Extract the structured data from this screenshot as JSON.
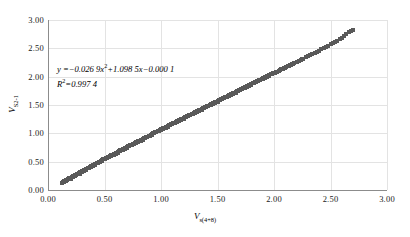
{
  "chart_data": {
    "type": "scatter",
    "title": "",
    "xlabel": "V_s(4+8)",
    "xlabel_base": "V",
    "xlabel_sub": "s(4+8)",
    "ylabel": "V_S2-1",
    "ylabel_base": "V",
    "ylabel_sub": "S2-1",
    "xlim": [
      0.0,
      3.0
    ],
    "ylim": [
      0.0,
      3.0
    ],
    "xticks": [
      "0.00",
      "0.50",
      "1.00",
      "1.50",
      "2.00",
      "2.50",
      "3.00"
    ],
    "yticks": [
      "0.00",
      "0.50",
      "1.00",
      "1.50",
      "2.00",
      "2.50",
      "3.00"
    ],
    "xtick_values": [
      0.0,
      0.5,
      1.0,
      1.5,
      2.0,
      2.5,
      3.0
    ],
    "ytick_values": [
      0.0,
      0.5,
      1.0,
      1.5,
      2.0,
      2.5,
      3.0
    ],
    "grid": true,
    "legend": "none",
    "marker": "square",
    "marker_color": "#595959",
    "grid_color": "#e3e3e3",
    "axis_color": "#8c8c8c",
    "annotations": {
      "equation_prefix": "y ",
      "equation": "=−0.026 9x",
      "equation_exp": "2",
      "equation_rest": "+1.098 5x−0.000 1",
      "r_squared_prefix": "R",
      "r_squared_exp": "2",
      "r_squared_value": "=0.997 4"
    },
    "fit": {
      "type": "quadratic",
      "a": -0.0269,
      "b": 1.0985,
      "c": -0.0001,
      "r2": 0.9974
    },
    "points": [
      [
        0.12,
        0.13
      ],
      [
        0.13,
        0.14
      ],
      [
        0.14,
        0.15
      ],
      [
        0.15,
        0.16
      ],
      [
        0.16,
        0.17
      ],
      [
        0.17,
        0.18
      ],
      [
        0.18,
        0.2
      ],
      [
        0.19,
        0.21
      ],
      [
        0.2,
        0.22
      ],
      [
        0.21,
        0.23
      ],
      [
        0.22,
        0.24
      ],
      [
        0.23,
        0.25
      ],
      [
        0.24,
        0.26
      ],
      [
        0.25,
        0.27
      ],
      [
        0.26,
        0.29
      ],
      [
        0.27,
        0.3
      ],
      [
        0.28,
        0.31
      ],
      [
        0.29,
        0.31
      ],
      [
        0.3,
        0.33
      ],
      [
        0.31,
        0.34
      ],
      [
        0.32,
        0.35
      ],
      [
        0.33,
        0.36
      ],
      [
        0.34,
        0.37
      ],
      [
        0.35,
        0.38
      ],
      [
        0.36,
        0.39
      ],
      [
        0.37,
        0.41
      ],
      [
        0.38,
        0.42
      ],
      [
        0.39,
        0.43
      ],
      [
        0.4,
        0.44
      ],
      [
        0.41,
        0.45
      ],
      [
        0.42,
        0.46
      ],
      [
        0.43,
        0.47
      ],
      [
        0.44,
        0.48
      ],
      [
        0.45,
        0.49
      ],
      [
        0.46,
        0.5
      ],
      [
        0.47,
        0.51
      ],
      [
        0.48,
        0.53
      ],
      [
        0.49,
        0.54
      ],
      [
        0.5,
        0.55
      ],
      [
        0.51,
        0.56
      ],
      [
        0.52,
        0.57
      ],
      [
        0.53,
        0.58
      ],
      [
        0.54,
        0.59
      ],
      [
        0.55,
        0.6
      ],
      [
        0.56,
        0.61
      ],
      [
        0.57,
        0.62
      ],
      [
        0.58,
        0.63
      ],
      [
        0.59,
        0.64
      ],
      [
        0.6,
        0.65
      ],
      [
        0.61,
        0.66
      ],
      [
        0.62,
        0.67
      ],
      [
        0.63,
        0.69
      ],
      [
        0.64,
        0.7
      ],
      [
        0.65,
        0.71
      ],
      [
        0.66,
        0.72
      ],
      [
        0.67,
        0.73
      ],
      [
        0.68,
        0.74
      ],
      [
        0.69,
        0.75
      ],
      [
        0.7,
        0.76
      ],
      [
        0.71,
        0.77
      ],
      [
        0.72,
        0.78
      ],
      [
        0.73,
        0.79
      ],
      [
        0.74,
        0.8
      ],
      [
        0.75,
        0.81
      ],
      [
        0.76,
        0.82
      ],
      [
        0.77,
        0.83
      ],
      [
        0.78,
        0.84
      ],
      [
        0.79,
        0.85
      ],
      [
        0.8,
        0.86
      ],
      [
        0.81,
        0.87
      ],
      [
        0.82,
        0.88
      ],
      [
        0.83,
        0.89
      ],
      [
        0.84,
        0.9
      ],
      [
        0.85,
        0.91
      ],
      [
        0.86,
        0.92
      ],
      [
        0.87,
        0.93
      ],
      [
        0.88,
        0.94
      ],
      [
        0.89,
        0.95
      ],
      [
        0.9,
        0.96
      ],
      [
        0.91,
        0.97
      ],
      [
        0.92,
        0.99
      ],
      [
        0.93,
        1.0
      ],
      [
        0.94,
        1.01
      ],
      [
        0.95,
        1.02
      ],
      [
        0.96,
        1.03
      ],
      [
        0.97,
        1.04
      ],
      [
        0.98,
        1.05
      ],
      [
        0.99,
        1.06
      ],
      [
        1.0,
        1.07
      ],
      [
        1.01,
        1.08
      ],
      [
        1.02,
        1.09
      ],
      [
        1.03,
        1.1
      ],
      [
        1.04,
        1.11
      ],
      [
        1.05,
        1.12
      ],
      [
        1.06,
        1.13
      ],
      [
        1.07,
        1.14
      ],
      [
        1.08,
        1.15
      ],
      [
        1.09,
        1.16
      ],
      [
        1.1,
        1.17
      ],
      [
        1.11,
        1.18
      ],
      [
        1.12,
        1.19
      ],
      [
        1.13,
        1.2
      ],
      [
        1.14,
        1.21
      ],
      [
        1.15,
        1.22
      ],
      [
        1.16,
        1.23
      ],
      [
        1.17,
        1.24
      ],
      [
        1.18,
        1.25
      ],
      [
        1.19,
        1.26
      ],
      [
        1.2,
        1.27
      ],
      [
        1.21,
        1.28
      ],
      [
        1.22,
        1.29
      ],
      [
        1.23,
        1.3
      ],
      [
        1.24,
        1.31
      ],
      [
        1.25,
        1.32
      ],
      [
        1.26,
        1.33
      ],
      [
        1.27,
        1.34
      ],
      [
        1.28,
        1.35
      ],
      [
        1.29,
        1.36
      ],
      [
        1.3,
        1.37
      ],
      [
        1.31,
        1.38
      ],
      [
        1.32,
        1.39
      ],
      [
        1.33,
        1.4
      ],
      [
        1.34,
        1.41
      ],
      [
        1.35,
        1.42
      ],
      [
        1.36,
        1.43
      ],
      [
        1.37,
        1.44
      ],
      [
        1.38,
        1.45
      ],
      [
        1.39,
        1.46
      ],
      [
        1.4,
        1.47
      ],
      [
        1.41,
        1.48
      ],
      [
        1.42,
        1.49
      ],
      [
        1.43,
        1.5
      ],
      [
        1.44,
        1.51
      ],
      [
        1.45,
        1.52
      ],
      [
        1.46,
        1.53
      ],
      [
        1.47,
        1.54
      ],
      [
        1.48,
        1.55
      ],
      [
        1.49,
        1.56
      ],
      [
        1.5,
        1.57
      ],
      [
        1.51,
        1.58
      ],
      [
        1.52,
        1.59
      ],
      [
        1.53,
        1.6
      ],
      [
        1.54,
        1.61
      ],
      [
        1.55,
        1.62
      ],
      [
        1.56,
        1.63
      ],
      [
        1.57,
        1.64
      ],
      [
        1.58,
        1.65
      ],
      [
        1.59,
        1.66
      ],
      [
        1.6,
        1.67
      ],
      [
        1.61,
        1.68
      ],
      [
        1.62,
        1.69
      ],
      [
        1.63,
        1.7
      ],
      [
        1.64,
        1.71
      ],
      [
        1.65,
        1.72
      ],
      [
        1.66,
        1.73
      ],
      [
        1.67,
        1.74
      ],
      [
        1.68,
        1.75
      ],
      [
        1.69,
        1.76
      ],
      [
        1.7,
        1.77
      ],
      [
        1.71,
        1.78
      ],
      [
        1.72,
        1.79
      ],
      [
        1.73,
        1.8
      ],
      [
        1.74,
        1.81
      ],
      [
        1.75,
        1.82
      ],
      [
        1.76,
        1.83
      ],
      [
        1.77,
        1.84
      ],
      [
        1.78,
        1.85
      ],
      [
        1.79,
        1.86
      ],
      [
        1.8,
        1.87
      ],
      [
        1.81,
        1.88
      ],
      [
        1.82,
        1.89
      ],
      [
        1.83,
        1.9
      ],
      [
        1.84,
        1.91
      ],
      [
        1.85,
        1.92
      ],
      [
        1.86,
        1.93
      ],
      [
        1.87,
        1.94
      ],
      [
        1.88,
        1.95
      ],
      [
        1.89,
        1.96
      ],
      [
        1.9,
        1.97
      ],
      [
        1.91,
        1.98
      ],
      [
        1.92,
        1.99
      ],
      [
        1.93,
        2.0
      ],
      [
        1.94,
        2.01
      ],
      [
        1.95,
        2.02
      ],
      [
        1.96,
        2.03
      ],
      [
        1.97,
        2.04
      ],
      [
        1.98,
        2.05
      ],
      [
        1.99,
        2.06
      ],
      [
        2.0,
        2.07
      ],
      [
        2.02,
        2.08
      ],
      [
        2.04,
        2.1
      ],
      [
        2.05,
        2.12
      ],
      [
        2.06,
        2.13
      ],
      [
        2.08,
        2.14
      ],
      [
        2.1,
        2.16
      ],
      [
        2.12,
        2.18
      ],
      [
        2.13,
        2.19
      ],
      [
        2.14,
        2.2
      ],
      [
        2.15,
        2.21
      ],
      [
        2.16,
        2.22
      ],
      [
        2.18,
        2.24
      ],
      [
        2.2,
        2.26
      ],
      [
        2.22,
        2.28
      ],
      [
        2.24,
        2.3
      ],
      [
        2.26,
        2.32
      ],
      [
        2.28,
        2.34
      ],
      [
        2.3,
        2.36
      ],
      [
        2.32,
        2.38
      ],
      [
        2.34,
        2.4
      ],
      [
        2.36,
        2.42
      ],
      [
        2.38,
        2.44
      ],
      [
        2.4,
        2.46
      ],
      [
        2.42,
        2.48
      ],
      [
        2.44,
        2.5
      ],
      [
        2.46,
        2.52
      ],
      [
        2.48,
        2.54
      ],
      [
        2.5,
        2.57
      ],
      [
        2.52,
        2.59
      ],
      [
        2.54,
        2.61
      ],
      [
        2.56,
        2.63
      ],
      [
        2.58,
        2.66
      ],
      [
        2.6,
        2.69
      ],
      [
        2.62,
        2.72
      ],
      [
        2.64,
        2.75
      ],
      [
        2.66,
        2.78
      ],
      [
        2.68,
        2.8
      ],
      [
        2.7,
        2.82
      ],
      [
        0.14,
        0.16
      ],
      [
        0.18,
        0.19
      ],
      [
        0.22,
        0.23
      ],
      [
        0.26,
        0.28
      ],
      [
        0.3,
        0.32
      ],
      [
        0.34,
        0.36
      ],
      [
        0.38,
        0.41
      ],
      [
        0.42,
        0.45
      ],
      [
        0.46,
        0.49
      ],
      [
        0.5,
        0.54
      ],
      [
        0.54,
        0.58
      ],
      [
        0.58,
        0.62
      ],
      [
        0.62,
        0.66
      ],
      [
        0.66,
        0.71
      ],
      [
        0.7,
        0.75
      ],
      [
        0.74,
        0.79
      ],
      [
        0.78,
        0.83
      ],
      [
        0.82,
        0.87
      ],
      [
        0.86,
        0.91
      ],
      [
        0.9,
        0.95
      ],
      [
        0.94,
        1.0
      ],
      [
        0.98,
        1.04
      ],
      [
        1.02,
        1.08
      ],
      [
        1.06,
        1.12
      ],
      [
        1.1,
        1.16
      ],
      [
        1.14,
        1.2
      ],
      [
        1.18,
        1.24
      ],
      [
        1.22,
        1.28
      ],
      [
        1.26,
        1.32
      ],
      [
        1.3,
        1.36
      ],
      [
        1.34,
        1.4
      ],
      [
        1.38,
        1.44
      ],
      [
        1.42,
        1.48
      ],
      [
        1.46,
        1.52
      ],
      [
        1.5,
        1.56
      ],
      [
        1.54,
        1.6
      ],
      [
        1.58,
        1.64
      ],
      [
        1.62,
        1.68
      ],
      [
        1.66,
        1.72
      ],
      [
        1.7,
        1.76
      ],
      [
        1.74,
        1.8
      ],
      [
        1.78,
        1.84
      ],
      [
        1.82,
        1.88
      ],
      [
        1.86,
        1.92
      ],
      [
        1.9,
        1.96
      ],
      [
        1.94,
        2.0
      ],
      [
        1.98,
        2.04
      ],
      [
        2.03,
        2.09
      ],
      [
        2.07,
        2.13
      ],
      [
        2.11,
        2.17
      ],
      [
        0.16,
        0.16
      ],
      [
        0.2,
        0.2
      ],
      [
        0.24,
        0.25
      ],
      [
        0.28,
        0.29
      ],
      [
        0.32,
        0.34
      ],
      [
        0.36,
        0.38
      ],
      [
        0.4,
        0.42
      ],
      [
        0.44,
        0.47
      ],
      [
        0.48,
        0.51
      ],
      [
        0.52,
        0.56
      ],
      [
        0.56,
        0.6
      ],
      [
        0.6,
        0.64
      ],
      [
        0.64,
        0.68
      ],
      [
        0.68,
        0.73
      ],
      [
        0.72,
        0.77
      ],
      [
        0.76,
        0.81
      ],
      [
        0.8,
        0.85
      ],
      [
        0.84,
        0.89
      ],
      [
        0.88,
        0.93
      ],
      [
        0.92,
        0.97
      ],
      [
        0.96,
        1.02
      ],
      [
        1.0,
        1.06
      ],
      [
        1.04,
        1.1
      ],
      [
        1.08,
        1.14
      ],
      [
        1.12,
        1.18
      ],
      [
        1.16,
        1.22
      ],
      [
        1.2,
        1.26
      ],
      [
        1.24,
        1.3
      ],
      [
        1.28,
        1.34
      ],
      [
        1.32,
        1.38
      ],
      [
        1.36,
        1.42
      ],
      [
        1.4,
        1.46
      ],
      [
        1.44,
        1.5
      ],
      [
        1.48,
        1.54
      ],
      [
        1.52,
        1.58
      ],
      [
        1.56,
        1.62
      ],
      [
        1.6,
        1.66
      ],
      [
        1.64,
        1.7
      ],
      [
        1.68,
        1.74
      ],
      [
        1.72,
        1.78
      ],
      [
        1.76,
        1.82
      ],
      [
        1.8,
        1.86
      ],
      [
        1.84,
        1.9
      ],
      [
        1.88,
        1.94
      ],
      [
        1.92,
        1.98
      ],
      [
        1.96,
        2.02
      ],
      [
        2.01,
        2.07
      ],
      [
        2.09,
        2.15
      ],
      [
        2.17,
        2.23
      ],
      [
        2.25,
        2.31
      ]
    ]
  }
}
